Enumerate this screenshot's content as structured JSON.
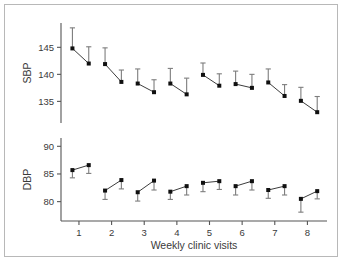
{
  "figure": {
    "background_color": "#ffffff",
    "frame_color": "#b8b8b8",
    "marker_color": "#101010",
    "errorbar_color": "#7d7d7d",
    "axis_color": "#555555"
  },
  "chart_data": {
    "type": "line",
    "title": "",
    "xlabel": "Weekly clinic visits",
    "ylabel": "",
    "grid": false,
    "legend": null,
    "x": [
      1,
      2,
      3,
      4,
      5,
      6,
      7,
      8
    ],
    "xtick_labels": [
      "1",
      "2",
      "3",
      "4",
      "5",
      "6",
      "7",
      "8"
    ],
    "xlim": [
      0.45,
      8.6
    ],
    "panels": [
      {
        "name": "SBP",
        "axis_label": "SBP",
        "ylim": [
          131.0,
          149.5
        ],
        "ytick_values": [
          145,
          140,
          135
        ],
        "ytick_labels": [
          "145",
          "140",
          "135"
        ],
        "errorbar_direction": "up",
        "series": [
          {
            "name": "first-measurement",
            "x_offset": -0.2,
            "values": [
              144.8,
              141.9,
              138.3,
              138.3,
              139.9,
              138.2,
              138.5,
              135.1
            ],
            "err_upper": [
              148.6,
              144.9,
              141.0,
              141.1,
              142.1,
              140.6,
              141.0,
              137.6
            ]
          },
          {
            "name": "second-measurement",
            "x_offset": 0.3,
            "values": [
              142.0,
              138.6,
              136.7,
              136.3,
              137.9,
              137.5,
              136.0,
              133.0
            ],
            "err_upper": [
              145.1,
              140.8,
              139.0,
              139.3,
              140.1,
              140.0,
              138.1,
              135.9
            ]
          }
        ]
      },
      {
        "name": "DBP",
        "axis_label": "DBP",
        "ylim": [
          76.5,
          91.5
        ],
        "ytick_values": [
          90,
          85,
          80
        ],
        "ytick_labels": [
          "90",
          "85",
          "80"
        ],
        "errorbar_direction": "down",
        "series": [
          {
            "name": "first-measurement",
            "x_offset": -0.2,
            "values": [
              85.7,
              82.0,
              81.7,
              81.8,
              83.4,
              82.8,
              82.1,
              80.5
            ],
            "err_lower": [
              84.3,
              80.4,
              80.1,
              80.4,
              81.8,
              81.2,
              80.6,
              78.1
            ]
          },
          {
            "name": "second-measurement",
            "x_offset": 0.3,
            "values": [
              86.6,
              83.9,
              83.8,
              82.8,
              83.7,
              83.7,
              82.8,
              81.9
            ],
            "err_lower": [
              85.1,
              82.3,
              82.1,
              81.2,
              82.2,
              82.1,
              81.2,
              80.5
            ]
          }
        ]
      }
    ]
  }
}
